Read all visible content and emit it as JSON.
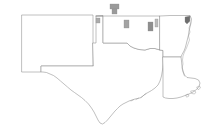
{
  "figure": {
    "type": "map",
    "background_color": "#ffffff",
    "outline_color": "#8c8c8c",
    "width": 213,
    "height": 132
  },
  "chart_data": {
    "type": "map",
    "title": "",
    "subtitle": "",
    "xlabel": "",
    "ylabel": "",
    "legend": [],
    "grid": false,
    "projection": "equirectangular-approx",
    "states": [
      {
        "name": "New Mexico",
        "abbr": "NM",
        "highlighted": false,
        "fill": "#ffffff",
        "path": "M 22 15 L 93 15 L 93 43 L 93 66 L 41 66 L 41 72 L 22 72 Z"
      },
      {
        "name": "Texas",
        "abbr": "TX",
        "highlighted": false,
        "fill": "#ffffff",
        "path": "M 93 43 L 96 43 L 96 16 L 103 16 L 103 43 L 127 43 L 130 46 L 135 49 L 140 50 L 146 50 L 150 48 L 155 48 L 160 50 L 163 50 L 163 55 L 163 70 L 162 78 L 160 85 L 157 90 L 152 93 L 147 95 L 143 97 L 139 98 L 135 99 L 131 100 L 127 101 L 122 103 L 118 106 L 115 110 L 112 114 L 109 118 L 106 121 L 103 123 L 100 124 L 97 122 L 95 118 L 93 113 L 90 108 L 86 103 L 82 99 L 78 96 L 74 93 L 70 90 L 66 87 L 62 83 L 58 79 L 54 76 L 50 74 L 46 72 L 41 72 L 41 66 L 93 66 Z"
      },
      {
        "name": "Oklahoma",
        "abbr": "OK",
        "highlighted": false,
        "fill": "#ffffff",
        "path": "M 96 16 L 160 16 L 160 50 L 155 48 L 150 48 L 146 50 L 140 50 L 135 49 L 130 46 L 127 43 L 103 43 L 103 16 Z"
      },
      {
        "name": "Arkansas",
        "abbr": "AR",
        "highlighted": false,
        "fill": "#ffffff",
        "path": "M 160 16 L 190 15 L 192 20 L 191 26 L 189 31 L 188 36 L 187 41 L 186 46 L 185 50 L 183 54 L 181 57 L 163 57 L 163 50 L 160 50 Z"
      },
      {
        "name": "Louisiana",
        "abbr": "LA",
        "highlighted": false,
        "fill": "#ffffff",
        "path": "M 163 57 L 181 57 L 182 62 L 183 68 L 184 74 L 186 78 L 190 79 L 195 79 L 199 81 L 200 85 L 198 89 L 195 92 L 191 94 L 187 96 L 183 97 L 179 98 L 175 99 L 171 99 L 167 98 L 163 97 L 163 90 L 163 80 L 163 70 L 163 57 Z"
      }
    ],
    "highlighted_counties": [
      {
        "id": "county-ok-border-north-1",
        "state": "Oklahoma",
        "value": "high",
        "fill": "#9a9a9a",
        "shape": "rect",
        "x": 110,
        "y": 4,
        "width": 9,
        "height": 5
      },
      {
        "id": "county-ok-border-north-2",
        "state": "Oklahoma",
        "value": "high",
        "fill": "#9a9a9a",
        "shape": "rect",
        "x": 112,
        "y": 9,
        "width": 5,
        "height": 5
      },
      {
        "id": "county-ok-panhandle",
        "state": "Oklahoma",
        "value": "medium",
        "fill": "#ababab",
        "shape": "rect",
        "x": 96,
        "y": 18,
        "width": 4,
        "height": 5
      },
      {
        "id": "county-ok-central",
        "state": "Oklahoma",
        "value": "medium",
        "fill": "#a3a3a3",
        "shape": "rect",
        "x": 124,
        "y": 20,
        "width": 5,
        "height": 8
      },
      {
        "id": "county-ok-east-1",
        "state": "Oklahoma",
        "value": "high",
        "fill": "#8f8f8f",
        "shape": "rect",
        "x": 148,
        "y": 22,
        "width": 5,
        "height": 9
      },
      {
        "id": "county-ok-east-2",
        "state": "Oklahoma",
        "value": "low",
        "fill": "#bdbdbd",
        "shape": "rect",
        "x": 155,
        "y": 19,
        "width": 3,
        "height": 8
      },
      {
        "id": "county-ar-northeast",
        "state": "Arkansas",
        "value": "highest",
        "fill": "#6e6e6e",
        "shape": "polygon",
        "points": "185,17 190,16 190,21 187,24 185,22"
      }
    ]
  }
}
